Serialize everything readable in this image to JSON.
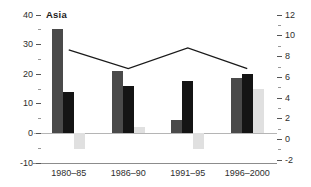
{
  "chart_data": {
    "type": "bar",
    "subtype": "combo-bar-line-dual-axis",
    "title": "Asia",
    "categories": [
      "1980–85",
      "1986–90",
      "1991–95",
      "1996–2000"
    ],
    "bar_series": [
      {
        "name": "dark-gray-bars",
        "axis": "left",
        "color": "#4a4a4a",
        "values": [
          35,
          21,
          4.5,
          18.5
        ]
      },
      {
        "name": "black-bars",
        "axis": "left",
        "color": "#141414",
        "values": [
          14,
          16,
          17.5,
          20
        ]
      },
      {
        "name": "light-gray-bars",
        "axis": "left",
        "color": "#e0e0e0",
        "values": [
          -5.5,
          2,
          -5.5,
          15
        ]
      }
    ],
    "line_series": {
      "name": "trend-line",
      "axis": "right",
      "color": "#1a1a1a",
      "values": [
        8.6,
        6.8,
        8.8,
        6.8
      ]
    },
    "axes": {
      "left": {
        "min": -10,
        "max": 40,
        "major_step": 10,
        "minor_step": 5,
        "tick_labels": [
          "40",
          "30",
          "20",
          "10",
          "0",
          "-10"
        ]
      },
      "right": {
        "min": -2,
        "max": 12,
        "major_step": 2,
        "minor_step": 1,
        "tick_labels": [
          "12",
          "10",
          "8",
          "6",
          "4",
          "2",
          "0",
          "-2"
        ]
      }
    },
    "layout_hints": {
      "zero_gridline": true,
      "baseline": true,
      "legend": "none",
      "grid": "off"
    },
    "colors": {
      "background": "#ffffff",
      "zero_line": "#b5b5b5",
      "baseline": "#8c8c8c",
      "tick_mark_major": "#555555",
      "tick_mark_minor": "#999999",
      "text": "#2e2e2e"
    }
  }
}
